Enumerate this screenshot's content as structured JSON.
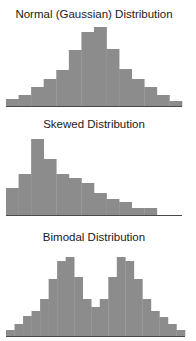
{
  "colors": {
    "bar": "#8c8c8c",
    "baseline": "#4a4a4a",
    "text": "#1a1a1a",
    "background": "#ffffff"
  },
  "chart_data": [
    {
      "type": "bar",
      "title": "Normal (Gaussian) Distribution",
      "xlabel": "",
      "ylabel": "",
      "grid": false,
      "categories": [
        1,
        2,
        3,
        4,
        5,
        6,
        7,
        8,
        9,
        10,
        11,
        12,
        13,
        14
      ],
      "values": [
        7,
        11,
        19,
        27,
        36,
        56,
        74,
        79,
        57,
        37,
        27,
        19,
        11,
        5
      ]
    },
    {
      "type": "bar",
      "title": "Skewed Distribution",
      "xlabel": "",
      "ylabel": "",
      "grid": false,
      "categories": [
        1,
        2,
        3,
        4,
        5,
        6,
        7,
        8,
        9,
        10,
        11,
        12,
        13,
        14
      ],
      "values": [
        27,
        41,
        76,
        56,
        41,
        37,
        32,
        22,
        16,
        13,
        7,
        7,
        0,
        0
      ]
    },
    {
      "type": "bar",
      "title": "Bimodal Distribution",
      "xlabel": "",
      "ylabel": "",
      "grid": false,
      "categories": [
        1,
        2,
        3,
        4,
        5,
        6,
        7,
        8,
        9,
        10,
        11,
        12,
        13,
        14,
        15,
        16,
        17,
        18,
        19,
        20,
        21
      ],
      "values": [
        6,
        12,
        20,
        25,
        37,
        57,
        75,
        79,
        59,
        37,
        29,
        37,
        59,
        79,
        75,
        57,
        37,
        25,
        19,
        12,
        6
      ]
    }
  ],
  "layout": [
    {
      "title_top": 8,
      "baseline": 106,
      "x0": 6,
      "x1": 182
    },
    {
      "title_top": 118,
      "baseline": 215,
      "x0": 6,
      "x1": 182
    },
    {
      "title_top": 231,
      "baseline": 336,
      "x0": 6,
      "x1": 185
    }
  ]
}
